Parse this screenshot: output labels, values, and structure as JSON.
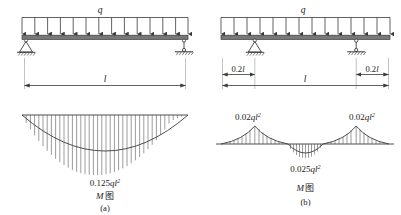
{
  "figure": {
    "title_a": "(a)",
    "title_b": "(b)",
    "moment_diagram_label": "M图",
    "load_label": "q",
    "span_label": "l",
    "overhang_label_left": "0.2l",
    "overhang_label_right": "0.2l",
    "panel_a": {
      "caption": "(a)",
      "beam_type": "simply-supported-beam",
      "load_label": "q",
      "span_label": "l",
      "moment_label": "M图",
      "max_moment_label": "0.125ql²",
      "max_moment_text_parts": {
        "coefficient": "0.125",
        "variable": "ql",
        "exponent": "2"
      },
      "supports": [
        {
          "name": "pin-support",
          "position": "left-end"
        },
        {
          "name": "link-roller-support",
          "position": "right-end"
        }
      ]
    },
    "panel_b": {
      "caption": "(b)",
      "beam_type": "overhanging-beam",
      "load_label": "q",
      "span_label": "l",
      "moment_label": "M图",
      "overhang_left": "0.2l",
      "overhang_right": "0.2l",
      "negative_moment_left_label": "0.02ql²",
      "negative_moment_right_label": "0.02ql²",
      "positive_moment_label": "0.025ql²",
      "moment_text_parts": {
        "support_coefficient": "0.02",
        "span_coefficient": "0.025",
        "variable": "ql",
        "exponent": "2"
      },
      "supports": [
        {
          "name": "pin-support",
          "position": "0.2l-from-left"
        },
        {
          "name": "link-roller-support",
          "position": "0.2l-from-right"
        }
      ]
    },
    "colors": {
      "line": "#3a3a3a",
      "text": "#1a1a1a",
      "beam_fill": "#6e6e6e",
      "hatch": "#4a4a4a"
    }
  }
}
